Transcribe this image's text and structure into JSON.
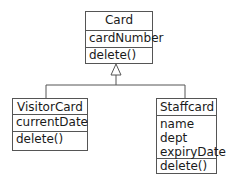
{
  "diagram": {
    "type": "uml-class-diagram",
    "classes": [
      {
        "name": "Card",
        "attributes": [
          "cardNumber"
        ],
        "methods": [
          "delete()"
        ]
      },
      {
        "name": "VisitorCard",
        "attributes": [
          "currentDate"
        ],
        "methods": [
          "delete()"
        ]
      },
      {
        "name": "Staffcard",
        "attributes": [
          "name",
          "dept",
          "expiryDate"
        ],
        "methods": [
          "delete()"
        ]
      }
    ],
    "relationships": [
      {
        "type": "generalization",
        "from": "VisitorCard",
        "to": "Card"
      },
      {
        "type": "generalization",
        "from": "Staffcard",
        "to": "Card"
      }
    ],
    "colors": {
      "line": "#555555",
      "text": "#1a1a1a",
      "background": "#ffffff"
    }
  }
}
